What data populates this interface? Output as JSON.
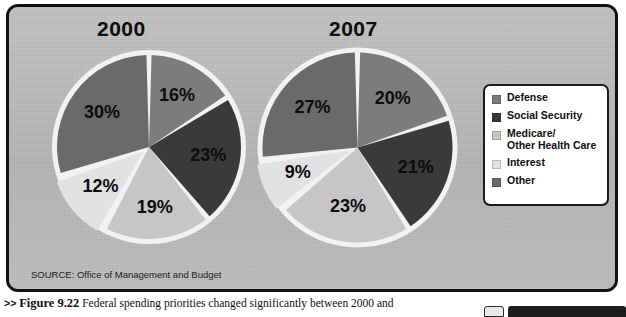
{
  "figure": {
    "source_note": "SOURCE: Office of Management and Budget",
    "caption_arrows": ">>",
    "caption_fignum": "Figure 9.22",
    "caption_text": " Federal spending priorities changed significantly between 2000 and"
  },
  "legend": {
    "items": [
      {
        "label": "Defense",
        "color": "#7c7c7c"
      },
      {
        "label": "Social Security",
        "color": "#3a3a3a"
      },
      {
        "label": "Medicare/\nOther Health Care",
        "color": "#c6c6c6"
      },
      {
        "label": "Interest",
        "color": "#e2e2e2"
      },
      {
        "label": "Other",
        "color": "#6a6a6a"
      }
    ]
  },
  "colors": {
    "panel_bg": "#b9b9b9",
    "panel_border": "#111111",
    "slice_gap": "#f2f2f2",
    "text": "#0d0d0d"
  },
  "chart_data": [
    {
      "type": "pie",
      "title": "2000",
      "categories": [
        "Defense",
        "Social Security",
        "Medicare/Other Health Care",
        "Interest",
        "Other"
      ],
      "values": [
        16,
        23,
        19,
        12,
        30
      ],
      "labels": [
        "16%",
        "23%",
        "19%",
        "12%",
        "30%"
      ],
      "colors": [
        "#7c7c7c",
        "#3a3a3a",
        "#c6c6c6",
        "#e2e2e2",
        "#6a6a6a"
      ],
      "unit": "%",
      "start_angle": 0,
      "direction": "clockwise",
      "legend_position": "right",
      "grid": false
    },
    {
      "type": "pie",
      "title": "2007",
      "categories": [
        "Defense",
        "Social Security",
        "Medicare/Other Health Care",
        "Interest",
        "Other"
      ],
      "values": [
        20,
        21,
        23,
        9,
        27
      ],
      "labels": [
        "20%",
        "21%",
        "23%",
        "9%",
        "27%"
      ],
      "colors": [
        "#7c7c7c",
        "#3a3a3a",
        "#c6c6c6",
        "#e2e2e2",
        "#6a6a6a"
      ],
      "unit": "%",
      "start_angle": 0,
      "direction": "clockwise",
      "legend_position": "right",
      "grid": false
    }
  ]
}
